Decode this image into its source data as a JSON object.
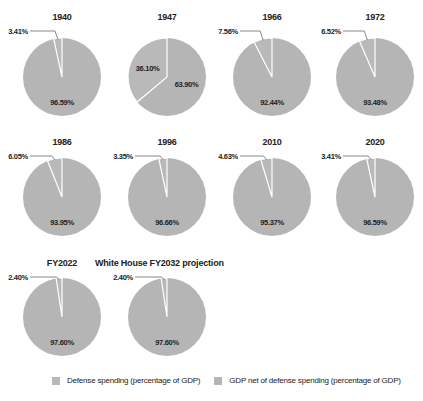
{
  "colors": {
    "defense": "#b9b9b9",
    "gdp_net": "#b5b5b5",
    "separator": "#ffffff",
    "leader": "#555555"
  },
  "chart_data": {
    "type": "pie",
    "title": "",
    "legend": [
      "Defense spending (percentage of GDP)",
      "GDP net of defense spending (percentage of GDP)"
    ],
    "legend_position": "bottom",
    "charts": [
      {
        "title": "1940",
        "defense": 3.41,
        "gdp_net": 96.59,
        "defense_label": "3.41%",
        "gdp_net_label": "96.59%"
      },
      {
        "title": "1947",
        "defense": 36.1,
        "gdp_net": 63.9,
        "defense_label": "36.10%",
        "gdp_net_label": "63.90%"
      },
      {
        "title": "1966",
        "defense": 7.56,
        "gdp_net": 92.44,
        "defense_label": "7.56%",
        "gdp_net_label": "92.44%"
      },
      {
        "title": "1972",
        "defense": 6.52,
        "gdp_net": 93.48,
        "defense_label": "6.52%",
        "gdp_net_label": "93.48%"
      },
      {
        "title": "1986",
        "defense": 6.05,
        "gdp_net": 93.95,
        "defense_label": "6.05%",
        "gdp_net_label": "93.95%"
      },
      {
        "title": "1996",
        "defense": 3.35,
        "gdp_net": 96.66,
        "defense_label": "3.35%",
        "gdp_net_label": "96.66%"
      },
      {
        "title": "2010",
        "defense": 4.63,
        "gdp_net": 95.37,
        "defense_label": "4.63%",
        "gdp_net_label": "95.37%"
      },
      {
        "title": "2020",
        "defense": 3.41,
        "gdp_net": 96.59,
        "defense_label": "3.41%",
        "gdp_net_label": "96.59%"
      },
      {
        "title": "FY2022",
        "defense": 2.4,
        "gdp_net": 97.6,
        "defense_label": "2.40%",
        "gdp_net_label": "97.60%"
      },
      {
        "title": "White House FY2032 projection",
        "defense": 2.4,
        "gdp_net": 97.6,
        "defense_label": "2.40%",
        "gdp_net_label": "97.60%"
      }
    ]
  }
}
